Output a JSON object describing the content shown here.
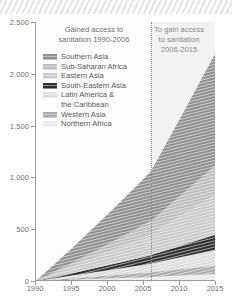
{
  "banner": {
    "name": "decorative-hatch-banner"
  },
  "chart_data": {
    "type": "area",
    "title": "",
    "xlabel": "",
    "ylabel": "",
    "stacked": true,
    "grid": false,
    "legend_position": "inside-top-left",
    "xlim": [
      1990,
      2015
    ],
    "ylim": [
      0,
      2500
    ],
    "x_ticks": [
      "1990",
      "1995",
      "2000",
      "2005",
      "2010",
      "2015"
    ],
    "x_tick_values": [
      1990,
      1995,
      2000,
      2005,
      2010,
      2015
    ],
    "y_ticks": [
      "0",
      "500",
      "1.000",
      "1.500",
      "2.000",
      "2.500"
    ],
    "y_tick_values": [
      0,
      500,
      1000,
      1500,
      2000,
      2500
    ],
    "x": [
      1990,
      1995,
      2000,
      2005,
      2006,
      2010,
      2015
    ],
    "annotations": [
      {
        "text_line1": "Gained access to",
        "text_line2": "sanitation 1990-2006",
        "region": "left"
      },
      {
        "text_line1": "To gain access",
        "text_line2": "to sanitation",
        "text_line3": "2006-2015",
        "region": "right"
      }
    ],
    "divider_year": 2006,
    "series": [
      {
        "name": "Northern Africa",
        "color": "#e9eaea",
        "values": [
          0,
          12,
          24,
          36,
          39,
          52,
          68
        ]
      },
      {
        "name": "Western Asia",
        "color": "#a8aaac",
        "values": [
          0,
          14,
          28,
          43,
          46,
          62,
          82
        ]
      },
      {
        "name": "Latin America & the Caribbean",
        "color": "#dcdddd",
        "values": [
          0,
          26,
          52,
          79,
          85,
          115,
          152
        ]
      },
      {
        "name": "South-Eastern Asia",
        "color": "#2f2f2f",
        "values": [
          0,
          24,
          49,
          74,
          80,
          110,
          148
        ]
      },
      {
        "name": "Eastern Asia",
        "color": "#c9cacb",
        "values": [
          0,
          62,
          126,
          191,
          205,
          286,
          390
        ]
      },
      {
        "name": "Sub-Saharan Africa",
        "color": "#bcbdbe",
        "values": [
          0,
          38,
          78,
          120,
          129,
          196,
          285
        ]
      },
      {
        "name": "Southern Asia",
        "color": "#8e9092",
        "values": [
          0,
          140,
          290,
          447,
          480,
          745,
          1085
        ]
      }
    ],
    "stack_order_bottom_to_top": [
      "Northern Africa",
      "Western Asia",
      "Latin America & the Caribbean",
      "South-Eastern Asia",
      "Eastern Asia",
      "Sub-Saharan Africa",
      "Southern Asia"
    ],
    "totals": [
      0,
      316,
      647,
      990,
      1064,
      1566,
      2210
    ]
  },
  "legend": {
    "items": [
      {
        "label": "Southern Asia",
        "color": "#8e9092"
      },
      {
        "label": "Sub-Saharan Africa",
        "color": "#bcbdbe"
      },
      {
        "label": "Eastern Asia",
        "color": "#c9cacb"
      },
      {
        "label": "South-Eastern Asia",
        "color": "#2f2f2f"
      },
      {
        "label": "Latin America &",
        "label2": "the Caribbean",
        "color": "#dcdddd"
      },
      {
        "label": "Western Asia",
        "color": "#a8aaac"
      },
      {
        "label": "Northern Africa",
        "color": "#e9eaea"
      }
    ]
  }
}
